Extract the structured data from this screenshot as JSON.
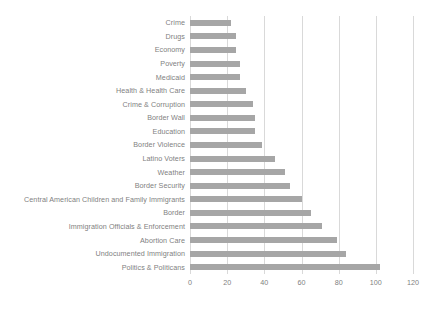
{
  "chart_data": {
    "type": "bar",
    "orientation": "horizontal",
    "title": "",
    "xlabel": "",
    "ylabel": "",
    "xlim": [
      0,
      120
    ],
    "xticks": [
      0,
      20,
      40,
      60,
      80,
      100,
      120
    ],
    "grid": true,
    "legend": false,
    "bar_color": "#a6a6a6",
    "grid_color": "#d9d9d9",
    "text_color": "#7f7f7f",
    "categories": [
      "Crime",
      "Drugs",
      "Economy",
      "Poverty",
      "Medicaid",
      "Health & Health Care",
      "Crime & Corruption",
      "Border Wall",
      "Education",
      "Border Violence",
      "Latino Voters",
      "Weather",
      "Border Security",
      "Central American Children and Family Immigrants",
      "Border",
      "Immigration Officials & Enforcement",
      "Abortion Care",
      "Undocumented Immigration",
      "Politics & Politicans"
    ],
    "values": [
      22,
      25,
      25,
      27,
      27,
      30,
      34,
      35,
      35,
      39,
      46,
      51,
      54,
      60,
      65,
      71,
      79,
      84,
      102
    ]
  }
}
